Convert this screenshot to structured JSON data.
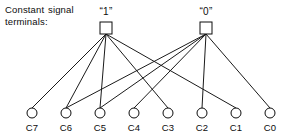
{
  "figure": {
    "caption": "Constant signal\nterminals:",
    "sources": [
      {
        "id": "one",
        "label": "“1”",
        "x": 106,
        "y": 28,
        "size": 12
      },
      {
        "id": "zero",
        "label": "“0”",
        "x": 206,
        "y": 28,
        "size": 12
      }
    ],
    "terminals": [
      {
        "label": "C7",
        "x": 32,
        "y": 113
      },
      {
        "label": "C6",
        "x": 66,
        "y": 113
      },
      {
        "label": "C5",
        "x": 100,
        "y": 113
      },
      {
        "label": "C4",
        "x": 134,
        "y": 113
      },
      {
        "label": "C3",
        "x": 168,
        "y": 113
      },
      {
        "label": "C2",
        "x": 202,
        "y": 113
      },
      {
        "label": "C1",
        "x": 236,
        "y": 113
      },
      {
        "label": "C0",
        "x": 270,
        "y": 113
      }
    ],
    "terminal_radius": 5,
    "connections": [
      {
        "from": "one",
        "to": "C7"
      },
      {
        "from": "one",
        "to": "C6"
      },
      {
        "from": "one",
        "to": "C5"
      },
      {
        "from": "one",
        "to": "C3"
      },
      {
        "from": "one",
        "to": "C1"
      },
      {
        "from": "zero",
        "to": "C4"
      },
      {
        "from": "zero",
        "to": "C2"
      },
      {
        "from": "zero",
        "to": "C0"
      },
      {
        "from": "zero",
        "to": "C6"
      },
      {
        "from": "zero",
        "to": "C5"
      }
    ],
    "colors": {
      "ink": "#0c0c0c",
      "background": "#ffffff",
      "wire": "#1a1a1a"
    },
    "stroke_width": 1
  }
}
